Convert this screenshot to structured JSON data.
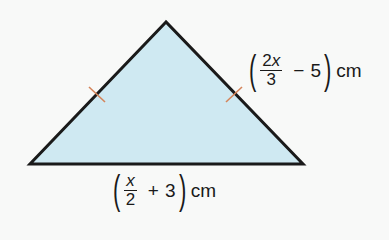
{
  "diagram": {
    "shape": "isosceles triangle",
    "fill_color": "#cfe9f2",
    "stroke_color": "#1a1a1a",
    "tick_color": "#d4845a",
    "vertices": {
      "apex": [
        166,
        22
      ],
      "bottom_left": [
        30,
        164
      ],
      "bottom_right": [
        303,
        164
      ]
    },
    "tick_marks": [
      [
        97,
        94
      ],
      [
        234,
        94
      ]
    ]
  },
  "labels": {
    "right_side": {
      "numerator_coef": "2",
      "numerator_var": "x",
      "denominator": "3",
      "operator": "−",
      "constant": "5",
      "unit": "cm"
    },
    "base": {
      "numerator_coef": "",
      "numerator_var": "x",
      "denominator": "2",
      "operator": "+",
      "constant": "3",
      "unit": "cm"
    }
  }
}
